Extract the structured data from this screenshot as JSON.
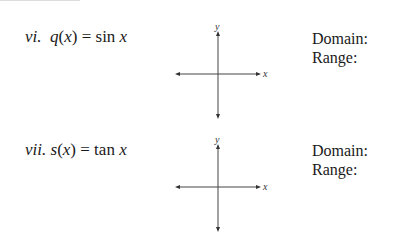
{
  "problems": [
    {
      "number": "vi.",
      "function_name": "q",
      "variable": "x",
      "equals": "=",
      "expression_fn": "sin",
      "expression_var": "x",
      "domain_label": "Domain:",
      "range_label": "Range:",
      "axes": {
        "x_label": "x",
        "y_label": "y"
      }
    },
    {
      "number": "vii.",
      "function_name": "s",
      "variable": "x",
      "equals": "=",
      "expression_fn": "tan",
      "expression_var": "x",
      "domain_label": "Domain:",
      "range_label": "Range:",
      "axes": {
        "x_label": "x",
        "y_label": "y"
      }
    }
  ]
}
